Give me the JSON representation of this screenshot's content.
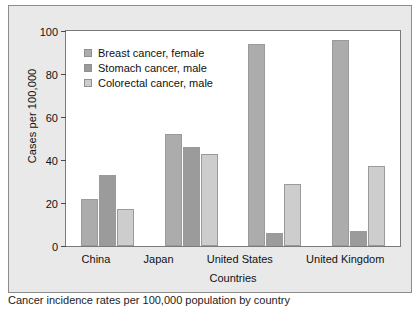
{
  "chart_data": {
    "type": "bar",
    "title": "",
    "xlabel": "Countries",
    "ylabel": "Cases per 100,000",
    "categories": [
      "China",
      "Japan",
      "United States",
      "United Kingdom"
    ],
    "series": [
      {
        "name": "Breast cancer, female",
        "values": [
          22,
          52,
          94,
          96
        ],
        "color": "#acacac"
      },
      {
        "name": "Stomach cancer, male",
        "values": [
          33,
          46,
          6,
          7
        ],
        "color": "#9b9b9b"
      },
      {
        "name": "Colorectal cancer, male",
        "values": [
          17,
          43,
          29,
          37
        ],
        "color": "#cdcdcd"
      }
    ],
    "ylim": [
      0,
      100
    ],
    "yticks": [
      0,
      20,
      40,
      60,
      80,
      100
    ],
    "grid": false,
    "legend_position": "top-left inside plot"
  },
  "figure": {
    "background": "#e9e9e9",
    "plot_background": "#ffffff",
    "border_color": "#7a7a7a"
  },
  "caption": {
    "text": "Cancer incidence rates per 100,000 population by country"
  }
}
